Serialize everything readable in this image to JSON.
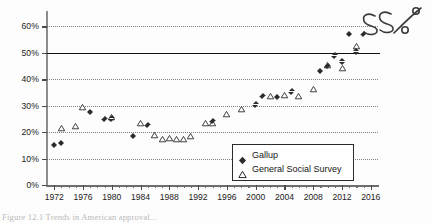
{
  "chart_data": {
    "type": "scatter",
    "title": "",
    "xlabel": "",
    "ylabel": "",
    "xlim": [
      1971,
      2017
    ],
    "ylim": [
      0,
      65
    ],
    "grid": true,
    "grid_style": "dotted horizontal",
    "legend_position": "inside lower right",
    "y_tick_labels": [
      "0%",
      "10%",
      "20%",
      "30%",
      "40%",
      "50%",
      "60%"
    ],
    "y_ticks": [
      0,
      10,
      20,
      30,
      40,
      50,
      60
    ],
    "x_tick_labels": [
      "1972",
      "1976",
      "1980",
      "1984",
      "1988",
      "1992",
      "1996",
      "2000",
      "2004",
      "2008",
      "2012",
      "2016"
    ],
    "x_ticks": [
      1972,
      1976,
      1980,
      1984,
      1988,
      1992,
      1996,
      2000,
      2004,
      2008,
      2012,
      2016
    ],
    "x_minor_tick_interval": 1,
    "reference_line": {
      "y": 50,
      "label": "50% reference line",
      "style": "solid black"
    },
    "annotations": [
      {
        "text": "55%",
        "style": "handwritten",
        "position": "top-right"
      }
    ],
    "series": [
      {
        "name": "Gallup",
        "marker": "filled-diamond",
        "color": "#2b2b2b",
        "points": [
          {
            "x": 1972,
            "y": 15.0
          },
          {
            "x": 1973,
            "y": 15.8
          },
          {
            "x": 1977,
            "y": 27.6
          },
          {
            "x": 1979,
            "y": 24.8
          },
          {
            "x": 1980,
            "y": 25.0
          },
          {
            "x": 1983,
            "y": 18.4
          },
          {
            "x": 1985,
            "y": 22.5
          },
          {
            "x": 1994,
            "y": 24.0
          },
          {
            "x": 2000,
            "y": 30.3
          },
          {
            "x": 2001,
            "y": 33.5
          },
          {
            "x": 2003,
            "y": 33.2
          },
          {
            "x": 2005,
            "y": 35.2
          },
          {
            "x": 2009,
            "y": 43.0
          },
          {
            "x": 2010,
            "y": 44.8
          },
          {
            "x": 2011,
            "y": 48.9
          },
          {
            "x": 2012,
            "y": 46.6
          },
          {
            "x": 2013,
            "y": 57.1
          },
          {
            "x": 2014,
            "y": 50.4
          },
          {
            "x": 2015,
            "y": 57.0
          }
        ]
      },
      {
        "name": "General Social Survey",
        "marker": "open-triangle",
        "color": "#2b2b2b",
        "points": [
          {
            "x": 1973,
            "y": 19.1
          },
          {
            "x": 1975,
            "y": 19.9
          },
          {
            "x": 1976,
            "y": 27.2
          },
          {
            "x": 1980,
            "y": 23.3
          },
          {
            "x": 1984,
            "y": 21.0
          },
          {
            "x": 1986,
            "y": 16.5
          },
          {
            "x": 1987,
            "y": 15.3
          },
          {
            "x": 1988,
            "y": 15.6
          },
          {
            "x": 1989,
            "y": 15.3
          },
          {
            "x": 1990,
            "y": 15.2
          },
          {
            "x": 1991,
            "y": 16.1
          },
          {
            "x": 1993,
            "y": 21.2
          },
          {
            "x": 1994,
            "y": 21.2
          },
          {
            "x": 1996,
            "y": 24.4
          },
          {
            "x": 1998,
            "y": 26.4
          },
          {
            "x": 2002,
            "y": 31.4
          },
          {
            "x": 2004,
            "y": 31.8
          },
          {
            "x": 2006,
            "y": 31.3
          },
          {
            "x": 2008,
            "y": 34.0
          },
          {
            "x": 2010,
            "y": 43.2
          },
          {
            "x": 2012,
            "y": 42.0
          },
          {
            "x": 2014,
            "y": 50.3
          }
        ]
      }
    ]
  },
  "legend": {
    "entries": [
      {
        "label": "Gallup",
        "marker": "filled-diamond"
      },
      {
        "label": "General Social Survey",
        "marker": "open-triangle"
      }
    ]
  },
  "annotation": {
    "handwritten_text": "55%"
  },
  "caption": {
    "text": "Figure 12.1  Trends in American approval..."
  },
  "colors": {
    "marker": "#2b2b2b",
    "axis": "#6e6e6e",
    "grid": "#6a6a6a",
    "reference_line": "#111111",
    "background": "#fdfdfd"
  }
}
